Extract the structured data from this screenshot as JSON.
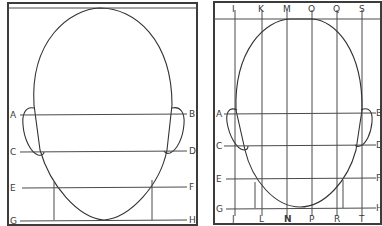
{
  "figure": {
    "left_panel": {
      "title": "Head proportions - horizontal guides",
      "horizontal_lines": [
        {
          "left": "A",
          "right": "B",
          "y": 115
        },
        {
          "left": "C",
          "right": "D",
          "y": 152
        },
        {
          "left": "E",
          "right": "F",
          "y": 187
        },
        {
          "left": "G",
          "right": "H",
          "y": 220
        }
      ]
    },
    "right_panel": {
      "title": "Head proportions - grid guides",
      "vertical_lines": [
        {
          "top": "I",
          "bottom": "J",
          "x": 235
        },
        {
          "top": "K",
          "bottom": "L",
          "x": 261
        },
        {
          "top": "M",
          "bottom": "N",
          "x": 287
        },
        {
          "top": "O",
          "bottom": "P",
          "x": 312
        },
        {
          "top": "Q",
          "bottom": "R",
          "x": 337
        },
        {
          "top": "S",
          "bottom": "T",
          "x": 362
        }
      ],
      "horizontal_lines": [
        {
          "left": "A",
          "right": "B",
          "y": 114
        },
        {
          "left": "C",
          "right": "D",
          "y": 146
        },
        {
          "left": "E",
          "right": "F",
          "y": 178
        },
        {
          "left": "G",
          "right": "H",
          "y": 208
        }
      ]
    },
    "colors": {
      "line": "#4a4a4a",
      "frame": "#3c3c3c",
      "background": "#ffffff"
    }
  }
}
